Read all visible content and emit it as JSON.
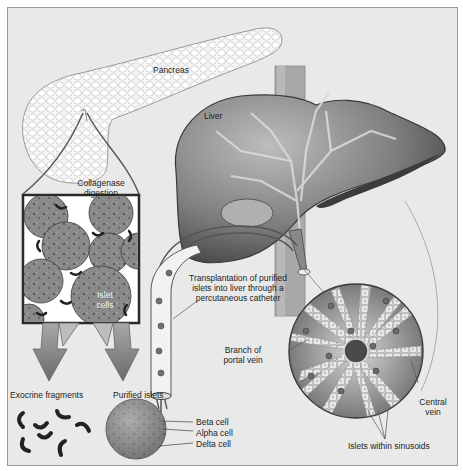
{
  "diagram": {
    "type": "medical-illustration",
    "labels": {
      "pancreas": "Pancreas",
      "liver": "Liver",
      "collagenase_line1": "Collagenase",
      "collagenase_line2": "digestion",
      "islet_line1": "Islet",
      "islet_line2": "cells",
      "transplant_line1": "Transplantation of purified",
      "transplant_line2": "islets into liver through a",
      "transplant_line3": "percutaneous catheter",
      "portal_line1": "Branch of",
      "portal_line2": "portal vein",
      "central_line1": "Central",
      "central_line2": "vein",
      "exocrine": "Exocrine fragments",
      "purified": "Purified islets",
      "beta": "Beta cell",
      "alpha": "Alpha cell",
      "delta": "Delta cell",
      "sinusoids": "Islets within sinusoids"
    },
    "colors": {
      "background": "#e9e9e9",
      "organ_dark": "#5a5a5a",
      "organ_mid": "#8c8c8c",
      "pancreas": "#f4f4f4",
      "arrow": "#7a7a7a"
    }
  }
}
